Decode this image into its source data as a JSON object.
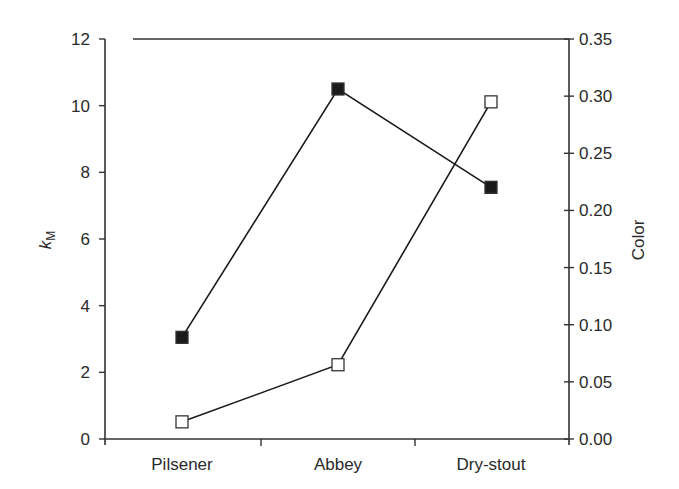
{
  "chart_data": {
    "type": "line",
    "title": "",
    "categories": [
      "Pilsener",
      "Abbey",
      "Dry-stout"
    ],
    "xlabel": "",
    "ylabel": "k_M",
    "ylabel_main": "k",
    "ylabel_sub": "M",
    "y2label": "Color",
    "ylim": [
      0,
      12
    ],
    "y2lim": [
      0,
      0.35
    ],
    "yticks": [
      "0",
      "2",
      "4",
      "6",
      "8",
      "10",
      "12"
    ],
    "y2ticks": [
      "0.00",
      "0.05",
      "0.10",
      "0.15",
      "0.20",
      "0.25",
      "0.30",
      "0.35"
    ],
    "grid": false,
    "legend": null,
    "series": [
      {
        "name": "k_M",
        "axis": "left",
        "marker": "filled-square",
        "color": "#1a1a1a",
        "values": [
          3.05,
          10.5,
          7.55
        ]
      },
      {
        "name": "Color",
        "axis": "right",
        "marker": "open-square",
        "color": "#1a1a1a",
        "values": [
          0.015,
          0.065,
          0.295
        ]
      }
    ]
  }
}
